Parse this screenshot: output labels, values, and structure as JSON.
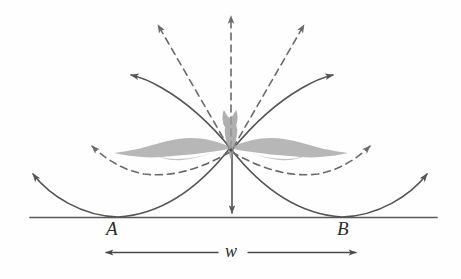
{
  "figure": {
    "background_color": "#fefefe",
    "stroke_color": "#555555",
    "label_color": "#2e2e2e",
    "bat_fill_color": "#a8a8a8"
  },
  "labels": {
    "point_a": "A",
    "point_b": "B",
    "width": "w"
  },
  "elements": {
    "ground_line_name": "ground-line",
    "bat_name": "bat-silhouette",
    "center_point_name": "launch-point"
  },
  "arrows": {
    "solid": [
      {
        "name": "solid-curve-far-left",
        "direction": "up-left",
        "style": "solid",
        "shape": "parabolic"
      },
      {
        "name": "solid-curve-inner-left",
        "direction": "up-left",
        "style": "solid",
        "shape": "parabolic"
      },
      {
        "name": "solid-curve-inner-right",
        "direction": "up-right",
        "style": "solid",
        "shape": "parabolic"
      },
      {
        "name": "solid-curve-far-right",
        "direction": "up-right",
        "style": "solid",
        "shape": "parabolic"
      },
      {
        "name": "solid-vertical-down",
        "direction": "down",
        "style": "solid",
        "shape": "straight"
      }
    ],
    "dashed": [
      {
        "name": "dashed-curve-left",
        "direction": "up-left",
        "style": "dashed",
        "shape": "curved"
      },
      {
        "name": "dashed-ray-upper-left",
        "direction": "up-left",
        "style": "dashed",
        "shape": "straight"
      },
      {
        "name": "dashed-ray-vertical",
        "direction": "up",
        "style": "dashed",
        "shape": "straight"
      },
      {
        "name": "dashed-ray-upper-right",
        "direction": "up-right",
        "style": "dashed",
        "shape": "straight"
      },
      {
        "name": "dashed-curve-right",
        "direction": "up-right",
        "style": "dashed",
        "shape": "curved"
      }
    ],
    "dimension": {
      "name": "width-dimension-arrow",
      "style": "solid",
      "direction": "double",
      "label": "w"
    }
  }
}
